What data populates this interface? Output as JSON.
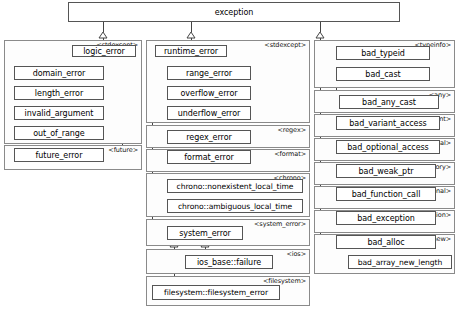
{
  "diagram": {
    "type": "uml-inheritance",
    "root": "exception",
    "colors": {
      "node_border": "#555555",
      "node_fill": "#ffffff",
      "group_border": "#8a8a8a",
      "group_fill": "#fdfdfd",
      "wire": "#444444",
      "text": "#000000"
    }
  },
  "root_node": {
    "label": "exception",
    "header": "<exception>"
  },
  "groups": [
    {
      "id": "stdexcept-left",
      "header": "<stdexcept>"
    },
    {
      "id": "future",
      "header": "<future>"
    },
    {
      "id": "stdexcept-mid",
      "header": "<stdexcept>"
    },
    {
      "id": "regex",
      "header": "<regex>"
    },
    {
      "id": "format",
      "header": "<format>"
    },
    {
      "id": "chrono",
      "header": "<chrono>"
    },
    {
      "id": "system_error",
      "header": "<system_error>"
    },
    {
      "id": "ios",
      "header": "<ios>"
    },
    {
      "id": "filesystem",
      "header": "<filesystem>"
    },
    {
      "id": "typeinfo",
      "header": "<typeinfo>"
    },
    {
      "id": "any",
      "header": "<any>"
    },
    {
      "id": "variant",
      "header": "<variant>"
    },
    {
      "id": "optional",
      "header": "<optional>"
    },
    {
      "id": "memory",
      "header": "<memory>"
    },
    {
      "id": "functional",
      "header": "<functional>"
    },
    {
      "id": "exception",
      "header": "<exception>"
    },
    {
      "id": "new",
      "header": "<new>"
    }
  ],
  "nodes": {
    "logic_error": {
      "label": "logic_error"
    },
    "domain_error": {
      "label": "domain_error"
    },
    "length_error": {
      "label": "length_error"
    },
    "invalid_argument": {
      "label": "invalid_argument"
    },
    "out_of_range": {
      "label": "out_of_range"
    },
    "future_error": {
      "label": "future_error"
    },
    "runtime_error": {
      "label": "runtime_error"
    },
    "range_error": {
      "label": "range_error"
    },
    "overflow_error": {
      "label": "overflow_error"
    },
    "underflow_error": {
      "label": "underflow_error"
    },
    "regex_error": {
      "label": "regex_error"
    },
    "format_error": {
      "label": "format_error"
    },
    "chrono_nonexistent_local_time": {
      "label": "chrono::nonexistent_local_time"
    },
    "chrono_ambiguous_local_time": {
      "label": "chrono::ambiguous_local_time"
    },
    "system_error": {
      "label": "system_error"
    },
    "ios_base_failure": {
      "label": "ios_base::failure"
    },
    "filesystem_filesystem_error": {
      "label": "filesystem::filesystem_error"
    },
    "bad_typeid": {
      "label": "bad_typeid"
    },
    "bad_cast": {
      "label": "bad_cast"
    },
    "bad_any_cast": {
      "label": "bad_any_cast"
    },
    "bad_variant_access": {
      "label": "bad_variant_access"
    },
    "bad_optional_access": {
      "label": "bad_optional_access"
    },
    "bad_weak_ptr": {
      "label": "bad_weak_ptr"
    },
    "bad_function_call": {
      "label": "bad_function_call"
    },
    "bad_exception": {
      "label": "bad_exception"
    },
    "bad_alloc": {
      "label": "bad_alloc"
    },
    "bad_array_new_length": {
      "label": "bad_array_new_length"
    }
  },
  "inheritance_edges": [
    {
      "base": "exception",
      "derived": "logic_error"
    },
    {
      "base": "exception",
      "derived": "runtime_error"
    },
    {
      "base": "exception",
      "derived": "bad_typeid"
    },
    {
      "base": "exception",
      "derived": "bad_cast"
    },
    {
      "base": "exception",
      "derived": "bad_variant_access"
    },
    {
      "base": "exception",
      "derived": "bad_optional_access"
    },
    {
      "base": "exception",
      "derived": "bad_weak_ptr"
    },
    {
      "base": "exception",
      "derived": "bad_function_call"
    },
    {
      "base": "exception",
      "derived": "bad_exception"
    },
    {
      "base": "exception",
      "derived": "bad_alloc"
    },
    {
      "base": "logic_error",
      "derived": "domain_error"
    },
    {
      "base": "logic_error",
      "derived": "length_error"
    },
    {
      "base": "logic_error",
      "derived": "invalid_argument"
    },
    {
      "base": "logic_error",
      "derived": "out_of_range"
    },
    {
      "base": "logic_error",
      "derived": "future_error"
    },
    {
      "base": "runtime_error",
      "derived": "range_error"
    },
    {
      "base": "runtime_error",
      "derived": "overflow_error"
    },
    {
      "base": "runtime_error",
      "derived": "underflow_error"
    },
    {
      "base": "runtime_error",
      "derived": "regex_error"
    },
    {
      "base": "runtime_error",
      "derived": "format_error"
    },
    {
      "base": "runtime_error",
      "derived": "chrono_nonexistent_local_time"
    },
    {
      "base": "runtime_error",
      "derived": "chrono_ambiguous_local_time"
    },
    {
      "base": "runtime_error",
      "derived": "system_error"
    },
    {
      "base": "system_error",
      "derived": "ios_base_failure"
    },
    {
      "base": "system_error",
      "derived": "filesystem_filesystem_error"
    },
    {
      "base": "bad_cast",
      "derived": "bad_any_cast"
    },
    {
      "base": "bad_alloc",
      "derived": "bad_array_new_length"
    }
  ]
}
